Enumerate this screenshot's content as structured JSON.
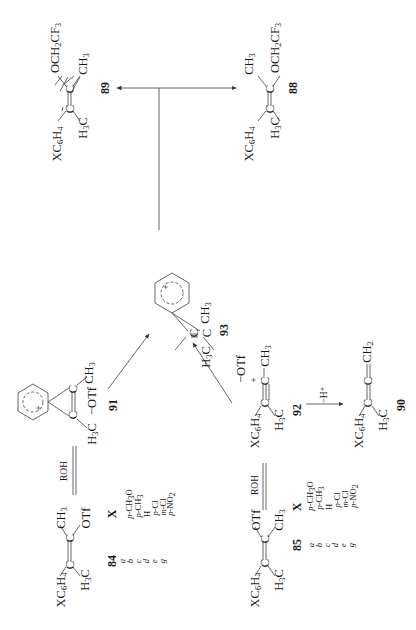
{
  "scheme": {
    "orientation": "rotated 90deg counter-clockwise",
    "compounds": {
      "c84": {
        "number": "84",
        "groups": {
          "aryl": "XC6H4",
          "methyl_a": "H3C",
          "methyl_b": "CH3",
          "leaving": "OTf"
        }
      },
      "c85": {
        "number": "85",
        "groups": {
          "aryl": "XC6H4",
          "methyl_a": "H3C",
          "methyl_b": "CH3",
          "leaving": "OTf"
        }
      },
      "c91": {
        "number": "91",
        "groups": {
          "methyl_a": "H3C",
          "methyl_b": "CH3",
          "counterion": "−OTf"
        }
      },
      "c92": {
        "number": "92",
        "groups": {
          "aryl": "XC6H4",
          "methyl_a": "H3C",
          "methyl_b": "CH3",
          "counterion": "−OTf",
          "charge": "+"
        }
      },
      "c93": {
        "number": "93",
        "groups": {
          "methyl_a": "H3C",
          "methyl_b": "CH3"
        }
      },
      "c90": {
        "number": "90",
        "groups": {
          "aryl": "XC6H4",
          "methyl_a": "H3C",
          "terminal": "CH2"
        }
      },
      "c88": {
        "number": "88",
        "groups": {
          "aryl": "XC6H4",
          "methyl_a": "H3C",
          "methyl_b": "CH3",
          "ether": "OCH2CF3"
        }
      },
      "c89": {
        "number": "89",
        "groups": {
          "aryl": "XC6H4",
          "methyl_a": "H3C",
          "methyl_b": "CH3",
          "ether": "OCH2CF3"
        }
      }
    },
    "reagents": {
      "roh_84": "ROH",
      "roh_85": "ROH",
      "deprotonation": "−H⁺"
    },
    "substituent_table": {
      "header": "X",
      "rows": [
        {
          "key": "a",
          "X": "p-CH3O"
        },
        {
          "key": "b",
          "X": "p-CH3"
        },
        {
          "key": "c",
          "X": "H"
        },
        {
          "key": "d",
          "X": "p-Cl"
        },
        {
          "key": "e",
          "X": "m-Cl"
        },
        {
          "key": "g",
          "X": "p-NO2"
        }
      ]
    }
  }
}
